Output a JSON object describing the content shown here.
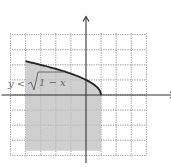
{
  "chart_data": {
    "type": "area",
    "title": "",
    "xlabel": "",
    "ylabel": "",
    "inequality_label": "y < √(1 − x)",
    "label_parts": {
      "lhs": "y <",
      "radicand": "1 − x"
    },
    "xlim": [
      -5,
      6
    ],
    "ylim": [
      -4,
      4
    ],
    "grid": true,
    "boundary": {
      "function": "sqrt(1 - x)",
      "x_start": -4,
      "x_end": 1,
      "style": "solid"
    },
    "shaded_region": {
      "x_range": [
        -4,
        1
      ],
      "y_lower": -3.7,
      "y_upper": "sqrt(1 - x)"
    },
    "colors": {
      "shade": "#cfcfcf",
      "curve": "#222222",
      "grid": "#9a9a9a"
    }
  }
}
